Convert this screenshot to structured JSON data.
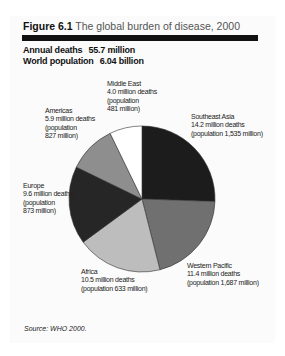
{
  "figure": {
    "number": "Figure 6.1",
    "title": "The global burden of disease, 2000",
    "stats": [
      {
        "label": "Annual deaths",
        "value": "55.7 million"
      },
      {
        "label": "World population",
        "value": "6.04 billion"
      }
    ],
    "source": "Source: WHO 2000."
  },
  "labels": {
    "middle_east": [
      "Middle East",
      "4.0 million deaths",
      "(population",
      "481 million)"
    ],
    "americas": [
      "Americas",
      "5.9 million deaths",
      "(population",
      "827 million)"
    ],
    "southeast_asia": [
      "Southeast Asia",
      "14.2 million deaths",
      "(population 1,535 million)"
    ],
    "europe": [
      "Europe",
      "9.6 million deaths",
      "(population",
      "873 million)"
    ],
    "africa": [
      "Africa",
      "10.5 million deaths",
      "(population 633 million)"
    ],
    "western_pacific": [
      "Western Pacific",
      "11.4 million deaths",
      "(population 1,687 million)"
    ]
  },
  "chart_data": {
    "type": "pie",
    "title": "The global burden of disease, 2000",
    "subtitle": "Annual deaths 55.7 million; World population 6.04 billion",
    "unit": "million deaths",
    "start_angle": "12 o'clock, clockwise",
    "categories": [
      "Southeast Asia",
      "Western Pacific",
      "Africa",
      "Europe",
      "Americas",
      "Middle East"
    ],
    "values": [
      14.2,
      11.4,
      10.5,
      9.6,
      5.9,
      4.0
    ],
    "population_millions": [
      1535,
      1687,
      633,
      873,
      827,
      481
    ],
    "colors": [
      "#1c1c1c",
      "#707070",
      "#bdbdbd",
      "#262626",
      "#8e8e8e",
      "#ffffff"
    ],
    "total_deaths": "55.7 million",
    "world_population": "6.04 billion",
    "legend": "none (direct labels)",
    "source": "WHO 2000"
  }
}
